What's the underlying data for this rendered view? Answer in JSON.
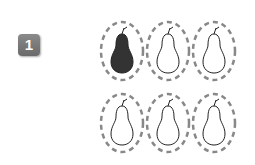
{
  "badge": {
    "number": "1",
    "color": "#777777"
  },
  "pears": [
    {
      "shaded": true
    },
    {
      "shaded": false
    },
    {
      "shaded": false
    },
    {
      "shaded": false
    },
    {
      "shaded": false
    },
    {
      "shaded": false
    }
  ],
  "colors": {
    "ring": "#888888",
    "pear_shaded": "#333333",
    "pear_outline": "#222222"
  }
}
